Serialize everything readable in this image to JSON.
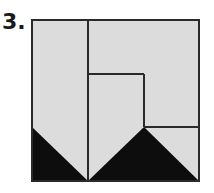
{
  "problem": {
    "label": "3."
  },
  "figure": {
    "colors": {
      "fill": "#dcdcdc",
      "dark": "#0d0d0d",
      "stroke": "#2a2a2a"
    },
    "outer_square": {
      "x": 32,
      "y": 20,
      "w": 167,
      "h": 161
    },
    "lines": [
      {
        "x1": 88,
        "y1": 20,
        "x2": 88,
        "y2": 181
      },
      {
        "x1": 88,
        "y1": 74,
        "x2": 144,
        "y2": 74
      },
      {
        "x1": 144,
        "y1": 74,
        "x2": 144,
        "y2": 127
      },
      {
        "x1": 144,
        "y1": 127,
        "x2": 199,
        "y2": 127
      }
    ],
    "triangles": [
      {
        "points": "32,127 32,181 88,181"
      },
      {
        "points": "88,181 144,127 199,181"
      }
    ]
  }
}
